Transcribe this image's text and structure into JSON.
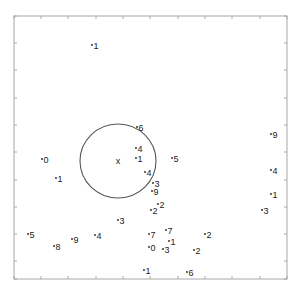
{
  "chart_data": {
    "type": "scatter",
    "title": "",
    "xlabel": "",
    "ylabel": "",
    "grid": false,
    "axes_box": {
      "left": 14,
      "top": 16,
      "right": 287,
      "bottom": 279
    },
    "x_ticks_px": [
      14,
      41,
      68,
      96,
      123,
      150,
      178,
      205,
      232,
      260,
      287
    ],
    "y_ticks_px": [
      16,
      43,
      70,
      98,
      125,
      152,
      180,
      207,
      234,
      261,
      279
    ],
    "circle": {
      "cx": 118,
      "cy": 161,
      "rx": 38,
      "ry": 37,
      "color": "#555555"
    },
    "center_marker": {
      "x": 118,
      "y": 161,
      "label": "x"
    },
    "points": [
      {
        "x": 92,
        "y": 45,
        "label": "1"
      },
      {
        "x": 137,
        "y": 127,
        "label": "6"
      },
      {
        "x": 136,
        "y": 148,
        "label": "4"
      },
      {
        "x": 136,
        "y": 158,
        "label": "1"
      },
      {
        "x": 172,
        "y": 158,
        "label": "5"
      },
      {
        "x": 42,
        "y": 159,
        "label": "0"
      },
      {
        "x": 56,
        "y": 178,
        "label": "1"
      },
      {
        "x": 145,
        "y": 172,
        "label": "4"
      },
      {
        "x": 153,
        "y": 183,
        "label": "3"
      },
      {
        "x": 152,
        "y": 191,
        "label": "9"
      },
      {
        "x": 158,
        "y": 204,
        "label": "2"
      },
      {
        "x": 151,
        "y": 210,
        "label": "2"
      },
      {
        "x": 271,
        "y": 134,
        "label": "9"
      },
      {
        "x": 271,
        "y": 170,
        "label": "4"
      },
      {
        "x": 271,
        "y": 194,
        "label": "1"
      },
      {
        "x": 262,
        "y": 210,
        "label": "3"
      },
      {
        "x": 118,
        "y": 220,
        "label": "3"
      },
      {
        "x": 28,
        "y": 234,
        "label": "5"
      },
      {
        "x": 54,
        "y": 246,
        "label": "8"
      },
      {
        "x": 72,
        "y": 239,
        "label": "9"
      },
      {
        "x": 95,
        "y": 235,
        "label": "4"
      },
      {
        "x": 149,
        "y": 234,
        "label": "7"
      },
      {
        "x": 166,
        "y": 230,
        "label": "7"
      },
      {
        "x": 169,
        "y": 241,
        "label": "1"
      },
      {
        "x": 149,
        "y": 247,
        "label": "0"
      },
      {
        "x": 163,
        "y": 249,
        "label": "3"
      },
      {
        "x": 205,
        "y": 234,
        "label": "2"
      },
      {
        "x": 194,
        "y": 250,
        "label": "2"
      },
      {
        "x": 144,
        "y": 270,
        "label": "1"
      },
      {
        "x": 187,
        "y": 272,
        "label": "6"
      }
    ]
  }
}
